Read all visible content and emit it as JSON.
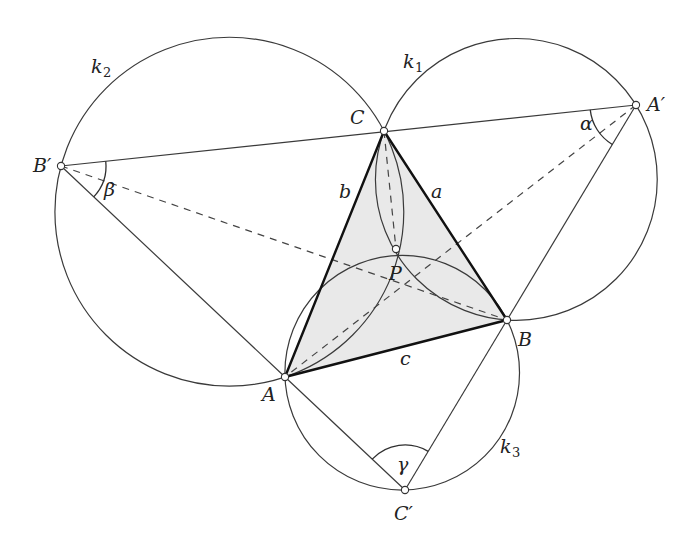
{
  "labels": {
    "vertices": {
      "A": "A",
      "B": "B",
      "C": "C",
      "P": "P"
    },
    "outer_vertices": {
      "A_prime": "A′",
      "B_prime": "B′",
      "C_prime": "C′"
    },
    "sides": {
      "a": "a",
      "b": "b",
      "c": "c"
    },
    "angles": {
      "alpha": "α",
      "beta": "β",
      "gamma": "γ"
    },
    "circles": [
      {
        "base": "k",
        "sub": "1"
      },
      {
        "base": "k",
        "sub": "2"
      },
      {
        "base": "k",
        "sub": "3"
      }
    ]
  },
  "colors": {
    "triangle_fill": "#e9e9e9",
    "stroke": "#3a3a3a",
    "point_fill": "#ffffff"
  }
}
